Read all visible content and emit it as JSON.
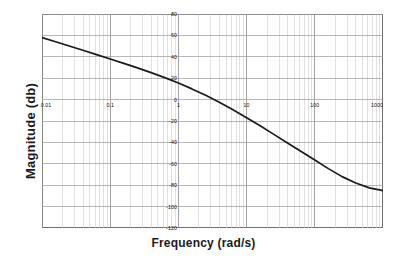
{
  "chart_data": {
    "type": "line",
    "title": "",
    "xlabel": "Frequency (rad/s)",
    "ylabel": "Magnitude (db)",
    "xscale": "log",
    "xlim": [
      0.01,
      1000
    ],
    "ylim": [
      -120,
      80
    ],
    "grid": true,
    "grid_minor": true,
    "legend": "none",
    "xticks": [
      0.01,
      0.1,
      1,
      10,
      100,
      1000
    ],
    "xticklabels": [
      "0.01",
      "0.1",
      "1",
      "10",
      "100",
      "1000"
    ],
    "yticks": [
      80,
      60,
      40,
      20,
      0,
      -20,
      -40,
      -60,
      -80,
      -100,
      -120
    ],
    "yticklabels": [
      "80",
      "60",
      "40",
      "20",
      "0",
      "-20",
      "-40",
      "-60",
      "-80",
      "-100",
      "-120"
    ],
    "series": [
      {
        "name": "magnitude",
        "color": "#1a1a1a",
        "x": [
          0.01,
          0.0158,
          0.0251,
          0.0398,
          0.0631,
          0.1,
          0.158,
          0.251,
          0.398,
          0.631,
          1.0,
          1.58,
          2.51,
          3.98,
          6.31,
          10.0,
          15.8,
          25.1,
          39.8,
          63.1,
          100.0,
          158.0,
          251.0,
          398.0,
          631.0,
          1000.0
        ],
        "y": [
          58.0,
          54.1,
          50.1,
          46.1,
          42.0,
          38.0,
          33.8,
          29.6,
          25.2,
          20.5,
          15.5,
          10.0,
          4.0,
          -2.5,
          -9.5,
          -17.0,
          -24.5,
          -32.5,
          -40.5,
          -48.5,
          -56.5,
          -64.5,
          -72.0,
          -78.0,
          -82.5,
          -85.0
        ]
      }
    ],
    "ylabel_ticks_x_position": "on-one-decade-axis",
    "xlabels_inside_at_db": 0
  },
  "axis_titles": {
    "x": "Frequency (rad/s)",
    "y": "Magnitude (db)"
  }
}
